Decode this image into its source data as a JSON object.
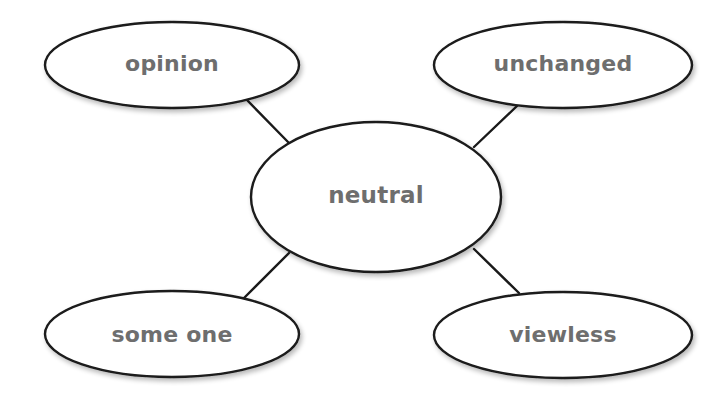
{
  "diagram": {
    "type": "word-web",
    "center": {
      "label": "neutral",
      "cx": 376,
      "cy": 197,
      "rx": 125,
      "ry": 75
    },
    "nodes": [
      {
        "label": "opinion",
        "position": "top-left",
        "cx": 172,
        "cy": 65,
        "rx": 127,
        "ry": 43
      },
      {
        "label": "unchanged",
        "position": "top-right",
        "cx": 563,
        "cy": 65,
        "rx": 129,
        "ry": 43
      },
      {
        "label": "some one",
        "position": "bottom-left",
        "cx": 172,
        "cy": 334,
        "rx": 127,
        "ry": 43
      },
      {
        "label": "viewless",
        "position": "bottom-right",
        "cx": 563,
        "cy": 335,
        "rx": 129,
        "ry": 43
      }
    ],
    "connectors": [
      {
        "from": "neutral",
        "to": "opinion"
      },
      {
        "from": "neutral",
        "to": "unchanged"
      },
      {
        "from": "neutral",
        "to": "some one"
      },
      {
        "from": "neutral",
        "to": "viewless"
      }
    ],
    "colors": {
      "background": "#ffffff",
      "outline": "#1a1a1a",
      "text": "#6e6e6e"
    }
  }
}
